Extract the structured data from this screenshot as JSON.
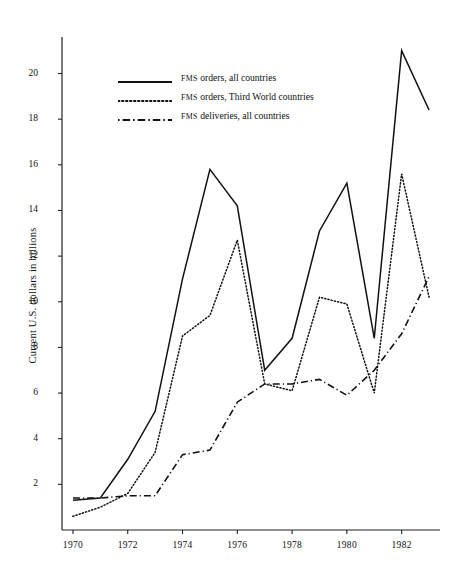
{
  "figure": {
    "background": "#ffffff",
    "ink": "#111111",
    "y_axis_label": "Current U.S. dollars in billions",
    "y_ticks": [
      2,
      4,
      6,
      8,
      10,
      12,
      14,
      16,
      18,
      20
    ],
    "x_ticks": [
      1970,
      1972,
      1974,
      1976,
      1978,
      1980,
      1982
    ],
    "x_range": [
      1969.6,
      1983.4
    ],
    "y_range": [
      0,
      21.6
    ]
  },
  "legend": {
    "position": "upper-left-inside",
    "items": [
      {
        "small_caps": "FMS",
        "rest": " orders, all countries",
        "style": "solid",
        "label": "FMS orders, all countries"
      },
      {
        "small_caps": "FMS",
        "rest": " orders, Third World countries",
        "style": "dotted",
        "label": "FMS orders, Third World countries"
      },
      {
        "small_caps": "FMS",
        "rest": " deliveries, all countries",
        "style": "dash-dot",
        "label": "FMS deliveries, all countries"
      }
    ]
  },
  "chart_data": {
    "type": "line",
    "title": "",
    "subtitle": "",
    "xlabel": "",
    "ylabel": "Current U.S. dollars in billions",
    "xlim": [
      1969.6,
      1983.4
    ],
    "ylim": [
      0,
      21.6
    ],
    "grid": false,
    "legend_position": "upper left",
    "x": [
      1970,
      1971,
      1972,
      1973,
      1974,
      1975,
      1976,
      1977,
      1978,
      1979,
      1980,
      1981,
      1982,
      1983
    ],
    "series": [
      {
        "name": "FMS orders, all countries",
        "style": "solid",
        "color": "#111111",
        "values": [
          1.3,
          1.4,
          3.1,
          5.2,
          11.0,
          15.8,
          14.2,
          7.0,
          8.4,
          13.1,
          15.2,
          8.4,
          21.0,
          18.4
        ]
      },
      {
        "name": "FMS orders, Third World countries",
        "style": "dotted",
        "color": "#111111",
        "values": [
          0.6,
          1.0,
          1.6,
          3.4,
          8.5,
          9.4,
          12.7,
          6.4,
          6.1,
          10.2,
          9.9,
          6.0,
          15.6,
          10.2
        ]
      },
      {
        "name": "FMS deliveries, all countries",
        "style": "dash-dot",
        "color": "#111111",
        "values": [
          1.4,
          1.4,
          1.5,
          1.5,
          3.3,
          3.5,
          5.6,
          6.4,
          6.4,
          6.6,
          5.9,
          7.0,
          8.6,
          11.1
        ]
      }
    ]
  }
}
